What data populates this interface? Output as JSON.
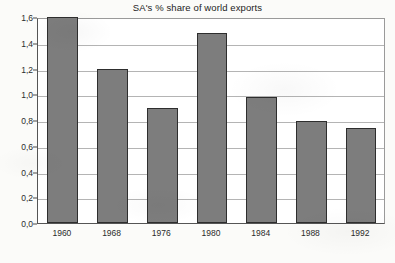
{
  "chart_data": {
    "type": "bar",
    "title": "SA's % share of world exports",
    "xlabel": "",
    "ylabel": "",
    "categories": [
      "1960",
      "1968",
      "1976",
      "1980",
      "1984",
      "1988",
      "1992"
    ],
    "values": [
      1.6,
      1.2,
      0.89,
      1.48,
      0.98,
      0.79,
      0.74
    ],
    "ylim": [
      0.0,
      1.6
    ],
    "ytick_values": [
      0.0,
      0.2,
      0.4,
      0.6,
      0.8,
      1.0,
      1.2,
      1.4,
      1.6
    ],
    "ytick_labels": [
      "0,0",
      "0,2",
      "0,4",
      "0,6",
      "0,8",
      "1,0",
      "1,2",
      "1,4",
      "1,6"
    ],
    "decimal_separator": ",",
    "grid": true,
    "grid_axis": "y",
    "legend": false,
    "legend_position": "none",
    "bar_color": "#7d7d7d",
    "bar_edge_color": "#2e2e2e",
    "grid_color": "#b4b4b4",
    "axis_color": "#555555",
    "plot_background": "#ffffff",
    "figure_background": "#fbfbf9",
    "text_color": "#2b2b2b"
  }
}
